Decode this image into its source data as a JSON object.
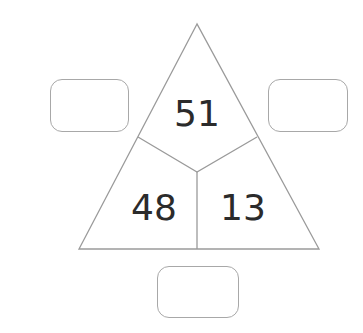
{
  "diagram": {
    "type": "number-triangle",
    "top_value": "51",
    "bottom_left_value": "48",
    "bottom_right_value": "13",
    "answer_boxes": {
      "left": "",
      "right": "",
      "bottom": ""
    },
    "colors": {
      "line": "#9a9a9a",
      "text": "#2b2b2b",
      "box_border": "#a8a8a8"
    }
  }
}
